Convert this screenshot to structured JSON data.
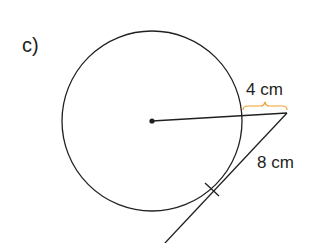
{
  "part_label": "c)",
  "labels": {
    "outside_segment": "4 cm",
    "tangent_segment": "8 cm"
  },
  "colors": {
    "stroke": "#231f20",
    "brace": "#f0a030",
    "background": "#ffffff"
  },
  "geometry": {
    "circle": {
      "cx": 152,
      "cy": 121,
      "r": 90
    },
    "center_point": {
      "x": 152,
      "y": 121
    },
    "external_point": {
      "x": 287,
      "y": 113
    },
    "tangent_end": {
      "x": 165,
      "y": 243
    },
    "tangent_point_tick": {
      "x": 212,
      "y": 189
    }
  }
}
